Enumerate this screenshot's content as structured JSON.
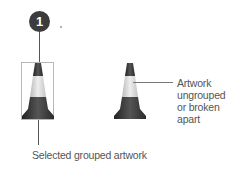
{
  "callout": {
    "number": "1"
  },
  "labels": {
    "selected": "Selected grouped artwork",
    "ungrouped_lines": [
      "Artwork",
      "ungrouped",
      "or broken",
      "apart"
    ]
  },
  "colors": {
    "cone_dark": "#3a3a3a",
    "cone_light": "#d4d4d4",
    "badge": "#3c3c3c",
    "selection_box": "#b8b8b8",
    "text": "#555555"
  }
}
